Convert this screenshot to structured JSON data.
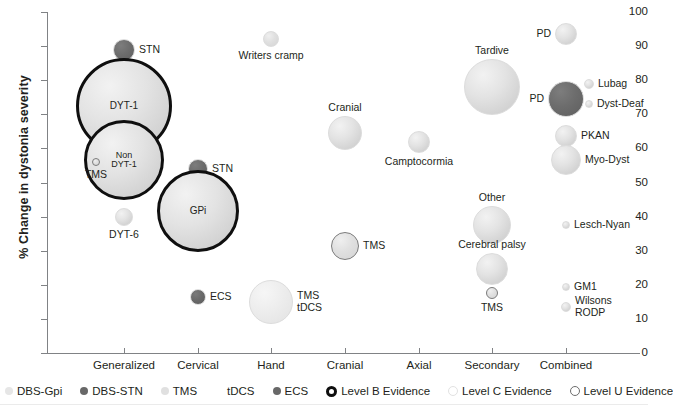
{
  "chart_data": {
    "type": "scatter",
    "title": "",
    "xlabel": "",
    "ylabel": "% Change in dystonia severity",
    "ylim": [
      0,
      100
    ],
    "ytick_labels": [
      "0",
      "10",
      "20",
      "30",
      "40",
      "50",
      "60",
      "70",
      "80",
      "90",
      "100"
    ],
    "ytick_values": [
      0,
      10,
      20,
      30,
      40,
      50,
      60,
      70,
      80,
      90,
      100
    ],
    "categories": [
      "Generalized",
      "Cervical",
      "Hand",
      "Cranial",
      "Axial",
      "Secondary",
      "Combined"
    ],
    "grid": false,
    "legend_position": "bottom",
    "note": "Bubble area encodes study size; outline encodes evidence level; fill encodes treatment modality.",
    "points": [
      {
        "label": "STN",
        "category": "Generalized",
        "x": 124,
        "y": 89,
        "size": 11,
        "modality": "DBS-STN",
        "evidence": "Level C",
        "label_pos": "right"
      },
      {
        "label": "DYT-1",
        "category": "Generalized",
        "x": 124,
        "y": 72.5,
        "size": 48,
        "modality": "DBS-Gpi",
        "evidence": "Level B",
        "label_pos": "inside"
      },
      {
        "label": "Non\nDYT-1",
        "category": "Generalized",
        "x": 124,
        "y": 56.5,
        "size": 40,
        "modality": "DBS-Gpi",
        "evidence": "Level B",
        "label_pos": "inside"
      },
      {
        "label": "TMS",
        "category": "Generalized",
        "x": 96,
        "y": 56,
        "size": 4,
        "modality": "TMS",
        "evidence": "Level U",
        "label_pos": "below"
      },
      {
        "label": "DYT-6",
        "category": "Generalized",
        "x": 124,
        "y": 40,
        "size": 9,
        "modality": "DBS-Gpi",
        "evidence": "Level C",
        "label_pos": "below"
      },
      {
        "label": "STN",
        "category": "Cervical",
        "x": 198,
        "y": 54,
        "size": 10,
        "modality": "DBS-STN",
        "evidence": "Level C",
        "label_pos": "right"
      },
      {
        "label": "GPi",
        "category": "Cervical",
        "x": 198,
        "y": 41.5,
        "size": 41,
        "modality": "DBS-Gpi",
        "evidence": "Level B",
        "label_pos": "inside"
      },
      {
        "label": "ECS",
        "category": "Cervical",
        "x": 198,
        "y": 16.5,
        "size": 8,
        "modality": "ECS",
        "evidence": "Level C",
        "label_pos": "right"
      },
      {
        "label": "Writers cramp",
        "category": "Hand",
        "x": 271,
        "y": 92,
        "size": 8,
        "modality": "TMS",
        "evidence": "Level C",
        "label_pos": "below"
      },
      {
        "label": "TMS\ntDCS",
        "category": "Hand",
        "x": 271,
        "y": 15,
        "size": 22,
        "modality": "tDCS",
        "evidence": "Level C",
        "label_pos": "right"
      },
      {
        "label": "Cranial",
        "category": "Cranial",
        "x": 345,
        "y": 64.5,
        "size": 17,
        "modality": "DBS-Gpi",
        "evidence": "Level C",
        "label_pos": "above"
      },
      {
        "label": "TMS",
        "category": "Cranial",
        "x": 345,
        "y": 31.5,
        "size": 14,
        "modality": "TMS",
        "evidence": "Level U",
        "label_pos": "right"
      },
      {
        "label": "Camptocormia",
        "category": "Axial",
        "x": 419,
        "y": 62,
        "size": 11,
        "modality": "DBS-Gpi",
        "evidence": "Level C",
        "label_pos": "below"
      },
      {
        "label": "Tardive",
        "category": "Secondary",
        "x": 492,
        "y": 78,
        "size": 28,
        "modality": "DBS-Gpi",
        "evidence": "Level C",
        "label_pos": "above"
      },
      {
        "label": "Other",
        "category": "Secondary",
        "x": 492,
        "y": 37.5,
        "size": 19,
        "modality": "DBS-Gpi",
        "evidence": "Level C",
        "label_pos": "above"
      },
      {
        "label": "Cerebral palsy",
        "category": "Secondary",
        "x": 492,
        "y": 24.5,
        "size": 16,
        "modality": "DBS-Gpi",
        "evidence": "Level C",
        "label_pos": "above"
      },
      {
        "label": "TMS",
        "category": "Secondary",
        "x": 492,
        "y": 17.5,
        "size": 6,
        "modality": "TMS",
        "evidence": "Level U",
        "label_pos": "below"
      },
      {
        "label": "PD",
        "category": "Combined",
        "x": 566,
        "y": 93.5,
        "size": 11,
        "modality": "DBS-Gpi",
        "evidence": "Level C",
        "label_pos": "left"
      },
      {
        "label": "PD",
        "category": "Combined",
        "x": 566,
        "y": 74.5,
        "size": 18,
        "modality": "DBS-STN",
        "evidence": "Level C",
        "label_pos": "left"
      },
      {
        "label": "Lubag",
        "category": "Combined",
        "x": 589,
        "y": 79,
        "size": 5,
        "modality": "DBS-Gpi",
        "evidence": "Level C",
        "label_pos": "right"
      },
      {
        "label": "Dyst-Deaf",
        "category": "Combined",
        "x": 589,
        "y": 73,
        "size": 4,
        "modality": "DBS-Gpi",
        "evidence": "Level C",
        "label_pos": "right"
      },
      {
        "label": "PKAN",
        "category": "Combined",
        "x": 566,
        "y": 63.5,
        "size": 11,
        "modality": "DBS-Gpi",
        "evidence": "Level C",
        "label_pos": "right"
      },
      {
        "label": "Myo-Dyst",
        "category": "Combined",
        "x": 566,
        "y": 56.5,
        "size": 15,
        "modality": "DBS-Gpi",
        "evidence": "Level C",
        "label_pos": "right"
      },
      {
        "label": "Lesch-Nyan",
        "category": "Combined",
        "x": 566,
        "y": 37.5,
        "size": 4,
        "modality": "DBS-Gpi",
        "evidence": "Level C",
        "label_pos": "right"
      },
      {
        "label": "GM1",
        "category": "Combined",
        "x": 566,
        "y": 19.5,
        "size": 4,
        "modality": "DBS-Gpi",
        "evidence": "Level C",
        "label_pos": "right"
      },
      {
        "label": "Wilsons\nRODP",
        "category": "Combined",
        "x": 566,
        "y": 13.5,
        "size": 5,
        "modality": "DBS-Gpi",
        "evidence": "Level C",
        "label_pos": "right"
      }
    ],
    "legend": [
      {
        "label": "DBS-Gpi",
        "marker": "dbs-gpi-dot"
      },
      {
        "label": "DBS-STN",
        "marker": "dbs-stn-dot"
      },
      {
        "label": "TMS",
        "marker": "tms-dot"
      },
      {
        "label": "tDCS",
        "marker": "tdcs-dot"
      },
      {
        "label": "ECS",
        "marker": "ecs-dot"
      },
      {
        "label": "Level B Evidence",
        "marker": "level-b-ring"
      },
      {
        "label": "Level C Evidence",
        "marker": "level-c-ring"
      },
      {
        "label": "Level U Evidence",
        "marker": "level-u-ring"
      }
    ],
    "colors": {
      "dbs_gpi": "#e3e3e3",
      "dbs_stn": "#686868",
      "tms": "#e0e0e0",
      "tdcs": "#ececec",
      "ecs": "#686868",
      "level_b_outline": "#0f0f0f",
      "level_c_outline": "#dcdcdc",
      "level_u_outline": "#7b7b7b",
      "axis": "#808285",
      "text": "#231f20"
    }
  },
  "axis_labels": {
    "y_title": "% Change in dystonia severity"
  }
}
